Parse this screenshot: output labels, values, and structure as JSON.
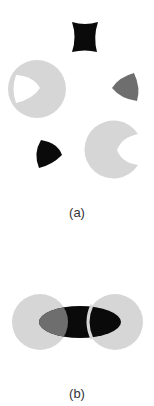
{
  "figure_a": {
    "caption": "(a)",
    "shapes": [
      {
        "name": "concave-spool-shape",
        "color": "#0a0a0a"
      },
      {
        "name": "circle-with-notch-left",
        "color": "#d6d6d6",
        "notch_color": "#ffffff"
      },
      {
        "name": "rounded-triangle-gray",
        "color": "#6e6e6e"
      },
      {
        "name": "rounded-triangle-black",
        "color": "#0a0a0a"
      },
      {
        "name": "circle-with-notch-right",
        "color": "#d6d6d6"
      }
    ]
  },
  "figure_b": {
    "caption": "(b)",
    "shapes": [
      {
        "name": "left-circle",
        "color": "#d6d6d6"
      },
      {
        "name": "right-circle",
        "color": "#d6d6d6"
      },
      {
        "name": "center-ellipse",
        "color": "#0a0a0a",
        "overlap_color": "#6e6e6e"
      }
    ]
  }
}
